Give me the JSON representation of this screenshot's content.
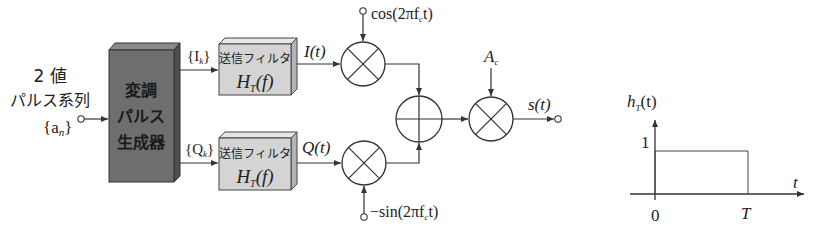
{
  "input": {
    "line1": "2 値",
    "line2": "パルス系列",
    "symbol": "{a",
    "symbol_sub": "n",
    "symbol_close": "}"
  },
  "generator": {
    "lines": [
      "変調",
      "パルス",
      "生成器"
    ]
  },
  "branch_i": {
    "seq_label": "{I",
    "seq_sub": "k",
    "seq_close": "}",
    "filter_title": "送信フィルタ",
    "filter_func": "H",
    "filter_func_sub": "T",
    "filter_func_arg": "(f)",
    "signal_label": "I(t)",
    "carrier_label": "cos(2πf",
    "carrier_sub": "c",
    "carrier_close": "t)"
  },
  "branch_q": {
    "seq_label": "{Q",
    "seq_sub": "k",
    "seq_close": "}",
    "filter_title": "送信フィルタ",
    "filter_func": "H",
    "filter_func_sub": "T",
    "filter_func_arg": "(f)",
    "signal_label": "Q(t)",
    "carrier_label": "−sin(2πf",
    "carrier_sub": "c",
    "carrier_close": "t)"
  },
  "amplitude": {
    "label": "A",
    "sub": "c"
  },
  "output": {
    "label": "s(t)"
  },
  "impulse_response": {
    "ylabel": "h",
    "ylabel_sub": "T",
    "ylabel_arg": "(t)",
    "xlabel": "t",
    "y_tick": "1",
    "x_tick_origin": "0",
    "x_tick_end": "T",
    "pulse_height": 1,
    "pulse_start": 0,
    "pulse_end_label": "T"
  }
}
